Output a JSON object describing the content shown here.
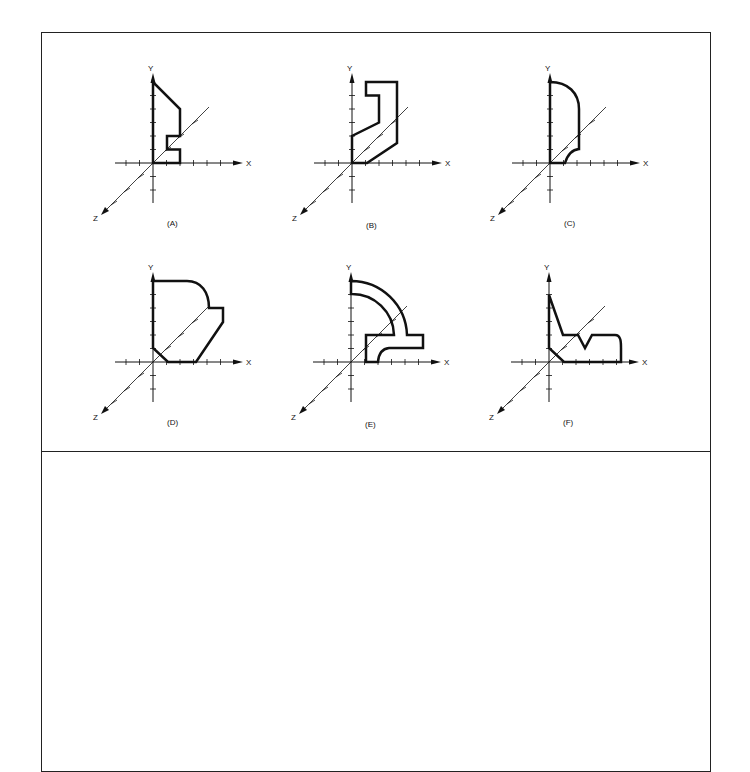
{
  "figure": {
    "panels": [
      {
        "id": "A",
        "caption": "(A)",
        "origin": [
          153,
          163
        ]
      },
      {
        "id": "B",
        "caption": "(B)",
        "origin": [
          352,
          163
        ]
      },
      {
        "id": "C",
        "caption": "(C)",
        "origin": [
          550,
          163
        ]
      },
      {
        "id": "D",
        "caption": "(D)",
        "origin": [
          153,
          362
        ]
      },
      {
        "id": "E",
        "caption": "(E)",
        "origin": [
          351,
          362
        ]
      },
      {
        "id": "F",
        "caption": "(F)",
        "origin": [
          549,
          362
        ]
      }
    ],
    "axis_labels": {
      "x": "X",
      "y": "Y",
      "z": "Z"
    },
    "colors": {
      "line": "#111111",
      "border": "#222222",
      "background": "#ffffff"
    }
  }
}
